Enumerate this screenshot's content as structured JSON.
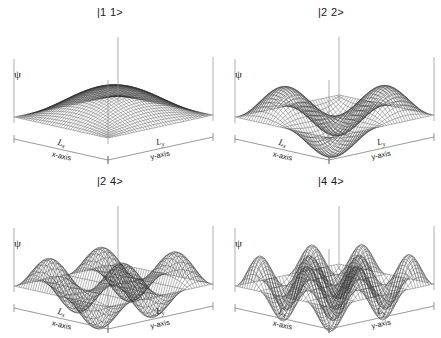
{
  "figure": {
    "background": "#ffffff",
    "mesh_color": "#2b2b2b",
    "axis_color": "#8d8d8d"
  },
  "axes": {
    "vertical_label": "ψ",
    "x_length_label": "L",
    "x_length_sub": "x",
    "y_length_label": "L",
    "y_length_sub": "y",
    "x_axis_name": "x-axis",
    "y_axis_name": "y-axis"
  },
  "panels": [
    {
      "title": "|1 1>",
      "nx": 1,
      "ny": 1
    },
    {
      "title": "|2 2>",
      "nx": 2,
      "ny": 2
    },
    {
      "title": "|2 4>",
      "nx": 2,
      "ny": 4
    },
    {
      "title": "|4 4>",
      "nx": 4,
      "ny": 4
    }
  ],
  "chart_data": {
    "type": "line",
    "xlabel": "x-axis",
    "ylabel": "y-axis",
    "zlabel": "ψ",
    "surface_function": "psi(x,y) = sin(nx*pi*x/Lx) * sin(ny*pi*y/Ly)",
    "grid": false,
    "legend": "none",
    "xlim": [
      0,
      1
    ],
    "ylim": [
      0,
      1
    ],
    "zlim": [
      -1,
      1
    ],
    "mesh_resolution": {
      "nu": 40,
      "nv": 40
    },
    "series": [
      {
        "name": "|1 1>",
        "nx": 1,
        "ny": 1,
        "nodes_x": 0,
        "nodes_y": 0,
        "lobes": 1
      },
      {
        "name": "|2 2>",
        "nx": 2,
        "ny": 2,
        "nodes_x": 1,
        "nodes_y": 1,
        "lobes": 4
      },
      {
        "name": "|2 4>",
        "nx": 2,
        "ny": 4,
        "nodes_x": 1,
        "nodes_y": 3,
        "lobes": 8
      },
      {
        "name": "|4 4>",
        "nx": 4,
        "ny": 4,
        "nodes_x": 3,
        "nodes_y": 3,
        "lobes": 16
      }
    ]
  }
}
